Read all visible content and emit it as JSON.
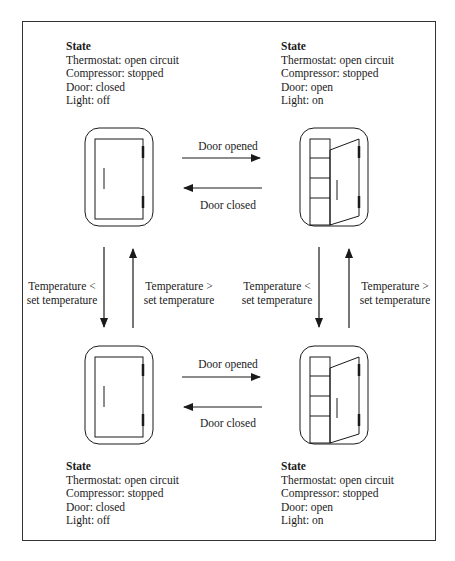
{
  "diagram": {
    "type": "state-transition",
    "states": [
      {
        "id": "top-left",
        "title": "State",
        "lines": [
          "Thermostat: open circuit",
          "Compressor: stopped",
          "Door: closed",
          "Light: off"
        ],
        "icon": "fridge-closed-icon"
      },
      {
        "id": "top-right",
        "title": "State",
        "lines": [
          "Thermostat: open circuit",
          "Compressor: stopped",
          "Door: open",
          "Light: on"
        ],
        "icon": "fridge-open-icon"
      },
      {
        "id": "bottom-left",
        "title": "State",
        "lines": [
          "Thermostat: open circuit",
          "Compressor: stopped",
          "Door: closed",
          "Light: off"
        ],
        "icon": "fridge-closed-icon"
      },
      {
        "id": "bottom-right",
        "title": "State",
        "lines": [
          "Thermostat: open circuit",
          "Compressor: stopped",
          "Door: open",
          "Light: on"
        ],
        "icon": "fridge-open-icon"
      }
    ],
    "transitions": {
      "top_open": "Door opened",
      "top_close": "Door closed",
      "bottom_open": "Door opened",
      "bottom_close": "Door closed",
      "left_down": [
        "Temperature <",
        "set temperature"
      ],
      "left_up": [
        "Temperature >",
        "set temperature"
      ],
      "right_down": [
        "Temperature <",
        "set temperature"
      ],
      "right_up": [
        "Temperature >",
        "set temperature"
      ]
    },
    "colors": {
      "stroke": "#1a1a1a",
      "frame": "#333333",
      "background": "#ffffff"
    }
  }
}
